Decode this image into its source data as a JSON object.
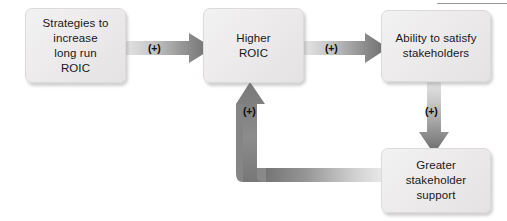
{
  "diagram": {
    "nodes": [
      {
        "id": "strategies",
        "label": "Strategies to\nincrease\nlong run\nROIC"
      },
      {
        "id": "higher_roic",
        "label": "Higher\nROIC"
      },
      {
        "id": "ability",
        "label": "Ability to satisfy\nstakeholders"
      },
      {
        "id": "support",
        "label": "Greater\nstakeholder\nsupport"
      }
    ],
    "edges": [
      {
        "id": "e1",
        "from": "strategies",
        "to": "higher_roic",
        "label": "(+)",
        "direction": "right"
      },
      {
        "id": "e2",
        "from": "higher_roic",
        "to": "ability",
        "label": "(+)",
        "direction": "right"
      },
      {
        "id": "e3",
        "from": "ability",
        "to": "support",
        "label": "(+)",
        "direction": "down"
      },
      {
        "id": "e4",
        "from": "support",
        "to": "higher_roic",
        "label": "(+)",
        "direction": "elbow-left-up"
      }
    ],
    "colors": {
      "box_fill": "#ebe9e9",
      "box_border": "#dcdada",
      "arrow_dark": "#6f6f6f",
      "arrow_light": "#e8e8e8",
      "text": "#181818"
    }
  }
}
